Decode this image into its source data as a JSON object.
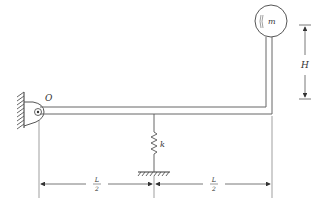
{
  "diagram": {
    "type": "mechanical-schematic",
    "labels": {
      "pivot": "O",
      "mass": "m",
      "spring": "k",
      "height": "H",
      "half_length_num": "L",
      "half_length_den": "2"
    },
    "colors": {
      "line": "#555555",
      "text": "#333333",
      "background": "#ffffff"
    },
    "dimensions": {
      "left_segment": "L/2",
      "right_segment": "L/2",
      "vertical_arm": "H"
    }
  }
}
